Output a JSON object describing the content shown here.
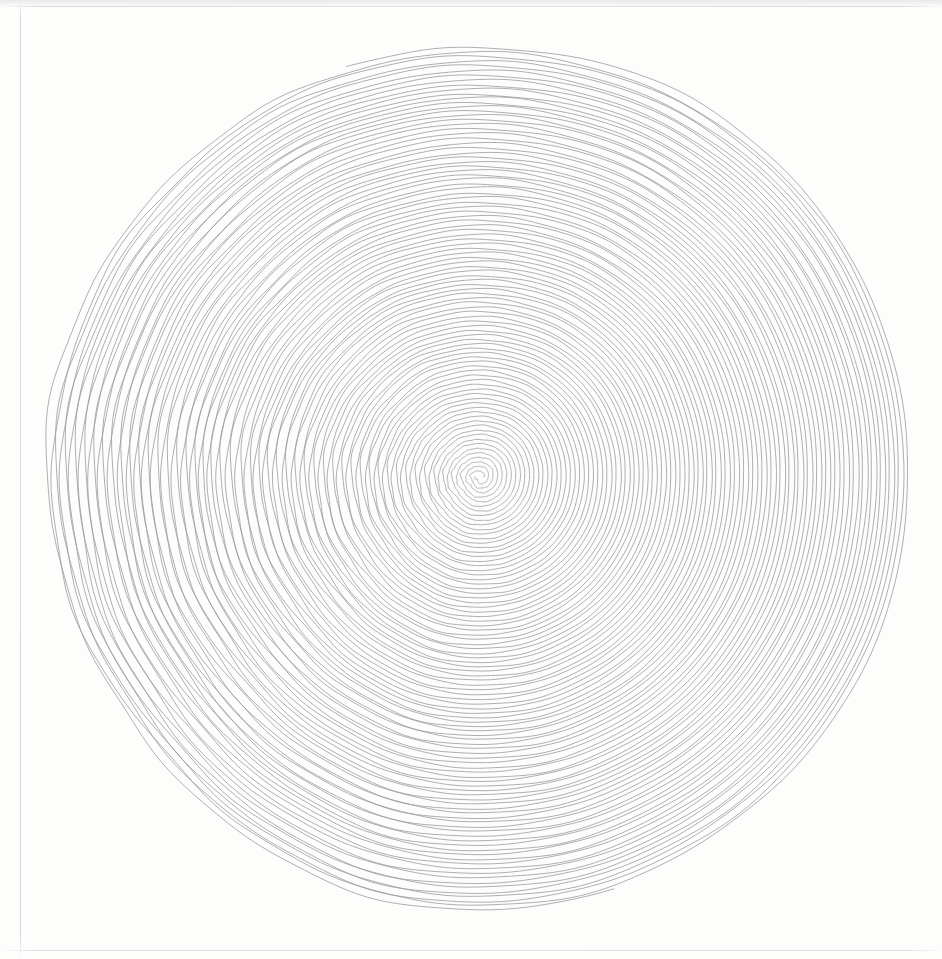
{
  "page": {
    "width": 942,
    "height": 959,
    "background_color": "#fdfdfc",
    "medium_note": "scanned line drawing"
  },
  "scan_marks": {
    "left_edge_x": 20,
    "top_edge_y": 6,
    "bottom_edge_y": 950,
    "edge_color": "#cdcdd2"
  },
  "artwork": {
    "name": "concentric-double-spiral",
    "stroke_color": "#9a9a9f",
    "stroke_width": 0.8,
    "stroke_linecap": "round"
  },
  "chart_data": {
    "type": "line",
    "title": "",
    "subtitle": "",
    "xlabel": "",
    "ylabel": "",
    "grid": false,
    "legend": null,
    "geometry": {
      "form": "archimedean-spiral",
      "arms": 2,
      "center_x": 480,
      "center_y": 477,
      "inner_radius": 4,
      "outer_radius": 432,
      "ring_spacing_px": 9.2,
      "pitch_per_turn_px": 18.4,
      "turns_per_arm": 46.8,
      "arm_start_angles_deg": [
        0,
        180
      ],
      "direction": "counterclockwise",
      "terminus_left": [
        50,
        482
      ],
      "terminus_right": [
        917,
        478
      ],
      "top_extent_y": 42,
      "bottom_extent_y": 905
    },
    "wobble": {
      "enabled": true,
      "radial_amplitude_px": 2.1,
      "angular_harmonics": [
        3,
        5,
        8,
        13,
        21
      ],
      "left_side_gain": 2.3,
      "right_side_gain": 0.55,
      "seed": 1847
    },
    "series": [
      {
        "name": "arm-a",
        "start_angle_deg": 0,
        "turns": 46.8,
        "color": "#9a9a9f"
      },
      {
        "name": "arm-b",
        "start_angle_deg": 180,
        "turns": 46.8,
        "color": "#9a9a9f"
      }
    ]
  }
}
